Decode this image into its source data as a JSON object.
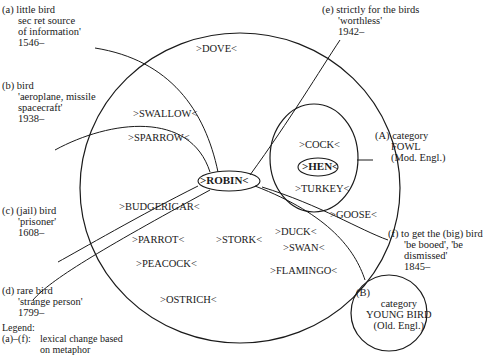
{
  "diagram": {
    "type": "semantic-change-diagram",
    "central_category": {
      "words": [
        "DOVE",
        "SWALLOW",
        "SPARROW",
        "ROBIN",
        "BUDGERIGAR",
        "PARROT",
        "STORK",
        "DUCK",
        "SWAN",
        "GOOSE",
        "PEACOCK",
        "FLAMINGO",
        "OSTRICH"
      ],
      "highlighted": "ROBIN"
    },
    "subcategory_a": {
      "words": [
        "COCK",
        "HEN",
        "TURKEY"
      ],
      "highlighted": "HEN"
    },
    "labels": {
      "dove": ">DOVE<",
      "swallow": ">SWALLOW<",
      "sparrow": ">SPARROW<",
      "robin": ">ROBIN<",
      "budgerigar": ">BUDGERIGAR<",
      "parrot": ">PARROT<",
      "stork": ">STORK<",
      "duck": ">DUCK<",
      "swan": ">SWAN<",
      "goose": ">GOOSE<",
      "peacock": ">PEACOCK<",
      "flamingo": ">FLAMINGO<",
      "ostrich": ">OSTRICH<",
      "cock": ">COCK<",
      "hen": ">HEN<",
      "turkey": ">TURKEY<"
    },
    "annotations": {
      "a": [
        "(a) little bird",
        "sec ret source",
        "of information'",
        "1546–"
      ],
      "b": [
        "(b) bird",
        "'aeroplane, missile",
        "spacecraft'",
        "1938–"
      ],
      "c": [
        "(c) (jail) bird",
        "'prisoner'",
        "1608–"
      ],
      "d": [
        "(d) rare bird",
        "'strange person'",
        "1799–"
      ],
      "e": [
        "(e) strictly for the birds",
        "'worthless'",
        "1942–"
      ],
      "f": [
        "(f)  to get the (big) bird",
        "'be booed', 'be",
        "dismissed'",
        "1845–"
      ],
      "A": [
        "(A)  category",
        "FOWL",
        "(Mod. Engl.)"
      ],
      "B_marker": "(B)",
      "B": [
        "category",
        "YOUNG BIRD",
        "(Old. Engl.)"
      ]
    },
    "legend": {
      "title": "Legend:",
      "rows": [
        {
          "key": "(a)–(f):",
          "value": "lexical change based"
        },
        {
          "key": "",
          "value": "on metaphor"
        },
        {
          "key": "(A):",
          "value": "specialization"
        },
        {
          "key": "(B):",
          "value": "generalization"
        }
      ],
      "note_lines": [
        "The years given refer to the date",
        "of the first quotation in the "
      ],
      "note_italic_1": "Oxford",
      "note_italic_2": "English Dictionary"
    },
    "colors": {
      "stroke": "#1a1a1a",
      "background": "#ffffff"
    }
  }
}
